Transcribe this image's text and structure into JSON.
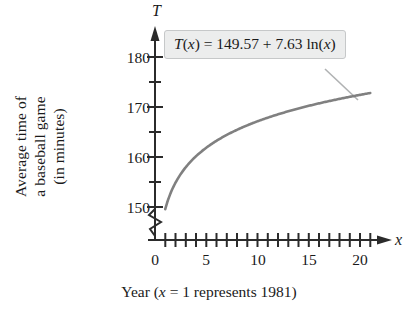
{
  "chart_data": {
    "type": "line",
    "title": "",
    "xlabel": "Year (x = 1 represents 1981)",
    "ylabel": "Average time of a baseball game (in minutes)",
    "ylabel_lines": [
      "Average time of",
      "a baseball game",
      "(in minutes)"
    ],
    "x_axis_letter": "x",
    "y_axis_letter": "T",
    "xlim": [
      0,
      22
    ],
    "ylim": [
      148,
      182
    ],
    "y_axis_break": true,
    "grid": false,
    "legend": null,
    "xticks": [
      0,
      5,
      10,
      15,
      20
    ],
    "xtick_labels": [
      "0",
      "5",
      "10",
      "15",
      "20"
    ],
    "x_minor_tick_step": 1,
    "yticks": [
      150,
      160,
      170,
      180
    ],
    "ytick_labels": [
      "150",
      "160",
      "170",
      "180"
    ],
    "y_minor_tick_step": 5,
    "annotation": {
      "text": "T(x) = 149.57 + 7.63 ln(x)",
      "parts": {
        "func_name": "T",
        "open_paren": "(",
        "var": "x",
        "close_paren": ")",
        "equals": "=",
        "intercept": "149.57",
        "plus": "+",
        "coefficient": "7.63",
        "ln": "ln"
      },
      "has_leader_line": true
    },
    "series": [
      {
        "name": "T(x) = 149.57 + 7.63 ln(x)",
        "color": "#808080",
        "formula": "149.57 + 7.63*ln(x)",
        "x": [
          1,
          2,
          3,
          4,
          5,
          6,
          7,
          8,
          9,
          10,
          11,
          12,
          13,
          14,
          15,
          16,
          17,
          18,
          19,
          20,
          21
        ],
        "values": [
          149.6,
          154.9,
          157.9,
          160.2,
          161.9,
          163.2,
          154.4,
          165.4,
          166.3,
          167.1,
          167.9,
          158.5,
          169.1,
          169.7,
          170.2,
          170.7,
          171.2,
          171.6,
          172.0,
          172.4,
          172.8
        ]
      }
    ]
  },
  "colors": {
    "curve": "#808080",
    "axis": "#2b2b2b",
    "callout_bg": "#eceded",
    "callout_border": "#c6c8c9",
    "leader_line": "#b0b2b3",
    "text": "#1a1a1a"
  }
}
